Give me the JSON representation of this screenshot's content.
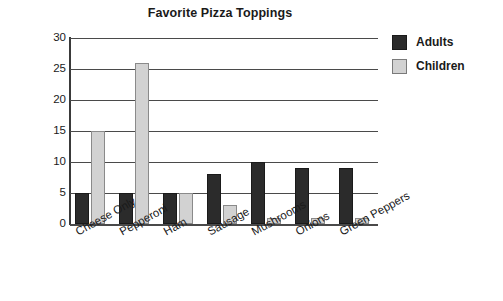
{
  "chart_data": {
    "type": "bar",
    "title": "Favorite Pizza Toppings",
    "xlabel": "",
    "ylabel": "",
    "ylim": [
      0,
      30
    ],
    "yticks": [
      0,
      5,
      10,
      15,
      20,
      25,
      30
    ],
    "grid": true,
    "legend_position": "right",
    "categories": [
      "Cheese Only",
      "Pepperoni",
      "Ham",
      "Sausage",
      "Mushrooms",
      "Onions",
      "Green Peppers"
    ],
    "series": [
      {
        "name": "Adults",
        "color": "#2b2b2b",
        "values": [
          5,
          5,
          5,
          8,
          10,
          9,
          9
        ]
      },
      {
        "name": "Children",
        "color": "#d2d2d2",
        "values": [
          15,
          26,
          5,
          3,
          1,
          1,
          1
        ]
      }
    ]
  },
  "legend": {
    "entries": [
      {
        "label": "Adults",
        "swatch": "adults"
      },
      {
        "label": "Children",
        "swatch": "children"
      }
    ]
  }
}
